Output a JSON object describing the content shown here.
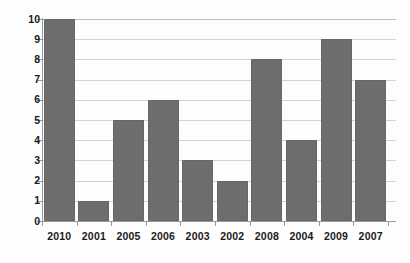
{
  "chart_data": {
    "type": "bar",
    "title": "",
    "subtitle": "",
    "xlabel": "",
    "ylabel": "",
    "categories": [
      "2010",
      "2001",
      "2005",
      "2006",
      "2003",
      "2002",
      "2008",
      "2004",
      "2009",
      "2007"
    ],
    "values": [
      10,
      1,
      5,
      6,
      3,
      2,
      8,
      4,
      9,
      7
    ],
    "series": [
      {
        "name": "",
        "values": [
          10,
          1,
          5,
          6,
          3,
          2,
          8,
          4,
          9,
          7
        ]
      }
    ],
    "ylim": [
      0,
      10
    ],
    "y_ticks": [
      "0",
      "1",
      "2",
      "3",
      "4",
      "5",
      "6",
      "7",
      "8",
      "9",
      "10"
    ],
    "grid": true,
    "grid_axis": "y",
    "legend": false,
    "legend_position": "none",
    "annotations": [],
    "colors": {
      "bar_fill": "#767676",
      "gridline": "#d2d2d2",
      "axis": "#9a9a9a",
      "text": "#1a1a1a",
      "background": "#fdfdfd"
    }
  }
}
